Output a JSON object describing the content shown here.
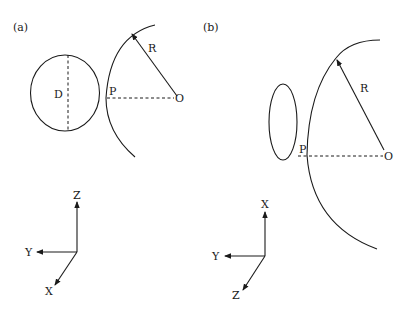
{
  "figure": {
    "panels": [
      {
        "id": "a",
        "label": "(a)",
        "aperture_shape": "circle",
        "aperture_label": "D",
        "radius_label": "R",
        "point_label": "P",
        "center_label": "O",
        "axes": {
          "up": "Z",
          "left": "Y",
          "diagonal": "X"
        }
      },
      {
        "id": "b",
        "label": "(b)",
        "aperture_shape": "ellipse",
        "radius_label": "R",
        "point_label": "P",
        "center_label": "O",
        "axes": {
          "up": "X",
          "left": "Y",
          "diagonal": "Z"
        }
      }
    ]
  },
  "colors": {
    "ink": "#1a1a1a",
    "background": "#ffffff"
  }
}
